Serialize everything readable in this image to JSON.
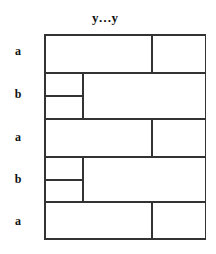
{
  "diagram": {
    "title": "y…y",
    "rows": [
      {
        "label": "a",
        "type": "a"
      },
      {
        "label": "b",
        "type": "b"
      },
      {
        "label": "a",
        "type": "a"
      },
      {
        "label": "b",
        "type": "b"
      },
      {
        "label": "a",
        "type": "a"
      }
    ],
    "line_color": "#333333"
  }
}
